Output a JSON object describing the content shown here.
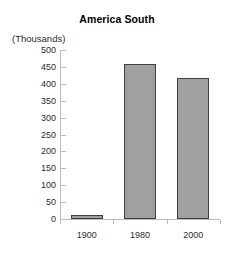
{
  "chart_data": {
    "type": "bar",
    "title": "America South",
    "unit_caption": "(Thousands)",
    "categories": [
      "1900",
      "1980",
      "2000"
    ],
    "values": [
      5,
      460,
      418
    ],
    "xlabel": "",
    "ylabel": "",
    "ylim": [
      0,
      500
    ],
    "yticks": [
      0,
      50,
      100,
      150,
      200,
      250,
      300,
      350,
      400,
      450,
      500
    ],
    "ytick_labels": [
      "0",
      "50",
      "100",
      "150",
      "200",
      "250",
      "300",
      "350",
      "400",
      "450",
      "500"
    ],
    "grid": false,
    "legend": false,
    "bar_color": "#a0a0a0",
    "bar_edge_color": "#404040",
    "axis_color": "#b9b9b9",
    "background": "#ffffff"
  }
}
